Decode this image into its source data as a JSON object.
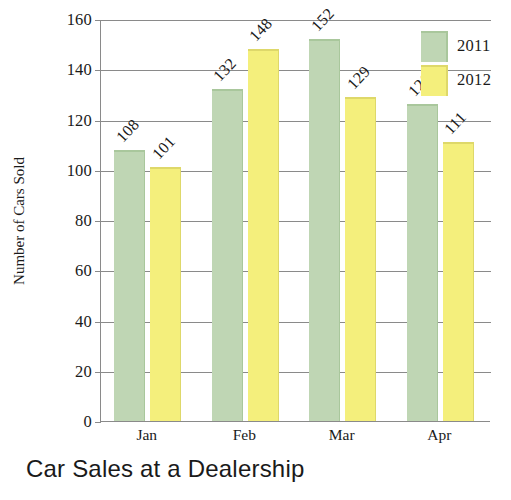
{
  "chart_data": {
    "type": "bar",
    "title": "Car Sales at a Dealership",
    "xlabel": "",
    "ylabel": "Number of Cars Sold",
    "categories": [
      "Jan",
      "Feb",
      "Mar",
      "Apr"
    ],
    "series": [
      {
        "name": "2011",
        "color": "#bfd6b4",
        "values": [
          108,
          132,
          152,
          126
        ]
      },
      {
        "name": "2012",
        "color": "#f4ef7c",
        "values": [
          101,
          148,
          129,
          111
        ]
      }
    ],
    "ylim": [
      0,
      160
    ],
    "ytick_step": 20,
    "yticks": [
      0,
      20,
      40,
      60,
      80,
      100,
      120,
      140,
      160
    ],
    "ytick_labels": [
      "0",
      "20",
      "40",
      "60",
      "80",
      "100",
      "120",
      "140",
      "160"
    ],
    "grid": true,
    "grid_axis": "y",
    "legend_position": "top-right",
    "data_labels": true,
    "data_label_rotation": -47,
    "axis_color": "#8a8a8a",
    "text_color": "#1a1a1a",
    "background": "#ffffff"
  },
  "legend": {
    "entries": [
      {
        "label": "2011",
        "swatch": "legend-swatch-2011"
      },
      {
        "label": "2012",
        "swatch": "legend-swatch-2012"
      }
    ]
  },
  "bar_labels": {
    "jan_2011": "108",
    "jan_2012": "101",
    "feb_2011": "132",
    "feb_2012": "148",
    "mar_2011": "152",
    "mar_2012": "129",
    "apr_2011": "126",
    "apr_2012": "111"
  }
}
